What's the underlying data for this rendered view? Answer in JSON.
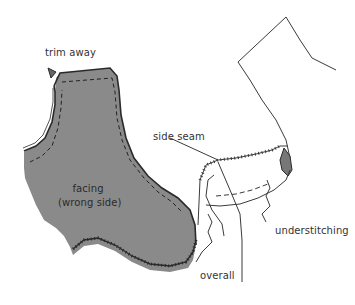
{
  "figure": {
    "type": "sewing-diagram",
    "colors": {
      "background": "#ffffff",
      "facing_fill": "#8a8a8a",
      "line": "#2a2a2a",
      "label_text": "#333333"
    },
    "labels": {
      "trim_away": "trim away",
      "side_seam": "side seam",
      "facing_line1": "facing",
      "facing_line2": "(wrong side)",
      "understitching": "understitching",
      "overall": "overall"
    }
  }
}
